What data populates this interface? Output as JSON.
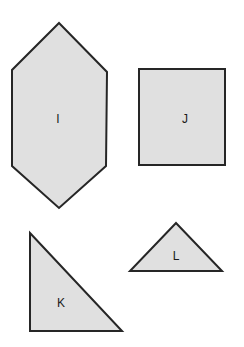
{
  "figure": {
    "width": 244,
    "height": 347,
    "background_color": "#ffffff",
    "shape_fill_color": "#e0e0e0",
    "shape_stroke_color": "#262626",
    "label_color": "#1a1a1a",
    "stroke_width": 2
  },
  "shapes": [
    {
      "id": "shape-i",
      "label": "I",
      "type": "hexagon",
      "points": "59,23 107,72 106,166 59,208 12,166 12,70",
      "label_x": 58,
      "label_y": 120
    },
    {
      "id": "shape-j",
      "label": "J",
      "type": "square",
      "points": "139,69 225,69 225,165 139,165",
      "label_x": 185,
      "label_y": 120
    },
    {
      "id": "shape-k",
      "label": "K",
      "type": "right-triangle",
      "points": "30,233 122,331 30,331",
      "label_x": 61,
      "label_y": 304
    },
    {
      "id": "shape-l",
      "label": "L",
      "type": "isosceles-triangle",
      "points": "176,223 222,271 130,271",
      "label_x": 176,
      "label_y": 257
    }
  ]
}
